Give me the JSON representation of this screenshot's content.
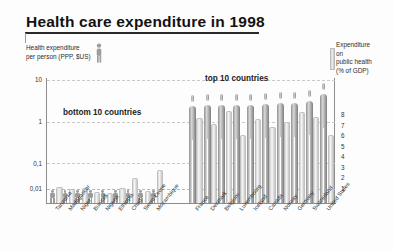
{
  "title": "Health care expenditure in 1998",
  "legend_left": {
    "line1": "Health expenditure",
    "line2": "per person (PPP, $US)",
    "icon": "person-icon"
  },
  "legend_right": {
    "line1": "Expenditure",
    "line2": "on",
    "line3": "public health",
    "line4": "(% of GDP)"
  },
  "annotations": {
    "bottom_group": "bottom 10 countries",
    "top_group": "top 10 countries"
  },
  "axes": {
    "left_ticks": [
      "10",
      "1",
      "0,1",
      "0,01"
    ],
    "right_ticks": [
      "8",
      "7",
      "6",
      "5",
      "4",
      "3",
      "2",
      "1"
    ]
  },
  "chart_data": {
    "type": "bar",
    "title": "Health care expenditure in 1998",
    "xlabel": "",
    "ylabel": "Health expenditure per person (PPP, $US)",
    "y2label": "Expenditure on public health (% of GDP)",
    "yscale": "log",
    "ylim": [
      0.01,
      10
    ],
    "y2lim": [
      0,
      8
    ],
    "ytick_labels": [
      "10",
      "1",
      "0,1",
      "0,01"
    ],
    "y2tick_labels": [
      "8",
      "7",
      "6",
      "5",
      "4",
      "3",
      "2",
      "1"
    ],
    "grid": true,
    "legend_position": "outside-top-left-and-top-right",
    "categories": [
      "Tanzania",
      "Madagascar",
      "Niger",
      "Burundi",
      "Nigeria",
      "Ethiopia",
      "Chad",
      "Sierra Leone",
      "Mozambique",
      "France",
      "Denmark",
      "Belgium",
      "Luxembourg",
      "Iceland",
      "Canada",
      "Norway",
      "Germany",
      "Switzerland",
      "United States"
    ],
    "series": [
      {
        "name": "Health expenditure per person (PPP, $US)",
        "axis": "left",
        "values": [
          0.012,
          0.012,
          0.013,
          0.013,
          0.014,
          0.015,
          0.016,
          0.018,
          0.02,
          1.9,
          2.0,
          2.0,
          2.1,
          2.1,
          2.2,
          2.3,
          2.4,
          2.6,
          4.1
        ]
      },
      {
        "name": "Expenditure on public health (% of GDP)",
        "axis": "right",
        "values": [
          1.3,
          1.1,
          1.2,
          0.9,
          0.8,
          1.2,
          2.1,
          1.0,
          2.8,
          7.3,
          6.8,
          7.9,
          5.8,
          7.2,
          6.5,
          7.0,
          7.8,
          7.4,
          5.8
        ]
      }
    ],
    "group_annotations": [
      {
        "label": "bottom 10 countries",
        "range": [
          "Tanzania",
          "Mozambique"
        ]
      },
      {
        "label": "top 10 countries",
        "range": [
          "France",
          "United States"
        ]
      }
    ]
  }
}
